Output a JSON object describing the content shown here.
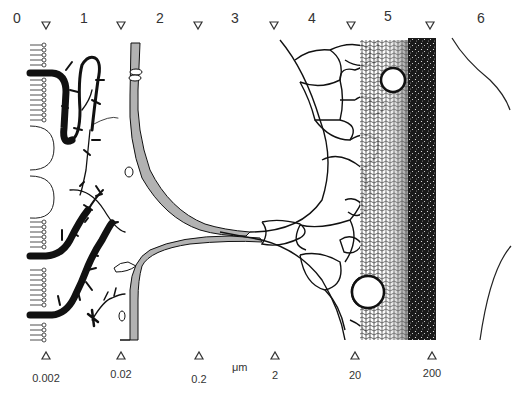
{
  "figure": {
    "zones": [
      {
        "label": "0",
        "x": 17
      },
      {
        "label": "1",
        "x": 84
      },
      {
        "label": "2",
        "x": 160
      },
      {
        "label": "3",
        "x": 235
      },
      {
        "label": "4",
        "x": 312
      },
      {
        "label": "5",
        "x": 388
      },
      {
        "label": "6",
        "x": 481
      }
    ],
    "boundary_markers": {
      "icon": "triangle-down-icon",
      "x": [
        46,
        121,
        198,
        274,
        351,
        430
      ]
    },
    "scale": {
      "unit": "μm",
      "icon": "triangle-up-icon",
      "ticks": [
        {
          "label": "0.002",
          "x": 46
        },
        {
          "label": "0.02",
          "x": 121
        },
        {
          "label": "0.2",
          "x": 199
        },
        {
          "label": "2",
          "x": 275
        },
        {
          "label": "20",
          "x": 355
        },
        {
          "label": "200",
          "x": 432
        }
      ]
    },
    "regions": [
      {
        "name": "lipid-bilayer-membrane",
        "zone": "0"
      },
      {
        "name": "glycoproteins-and-polysaccharide-chains",
        "zone": "1"
      },
      {
        "name": "fibrils-meeting-at-junction",
        "zone": "2-3"
      },
      {
        "name": "cellular-foam-large-bubbles",
        "zone": "3-4"
      },
      {
        "name": "fine-foam-gradient",
        "zone": "4-5"
      },
      {
        "name": "dense-material-bulk",
        "zone": "5"
      },
      {
        "name": "macroscopic-outline",
        "zone": "6"
      }
    ],
    "colors": {
      "ink": "#111111",
      "background": "#ffffff",
      "label": "#333333"
    }
  }
}
